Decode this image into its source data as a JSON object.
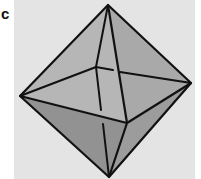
{
  "figure": {
    "panel_label": "c",
    "colors": {
      "background": "#e4e4e4",
      "face_light": "#b4b4b4",
      "face_mid": "#a6a6a6",
      "face_dark": "#8e8e8e",
      "edge": "#111111"
    }
  }
}
